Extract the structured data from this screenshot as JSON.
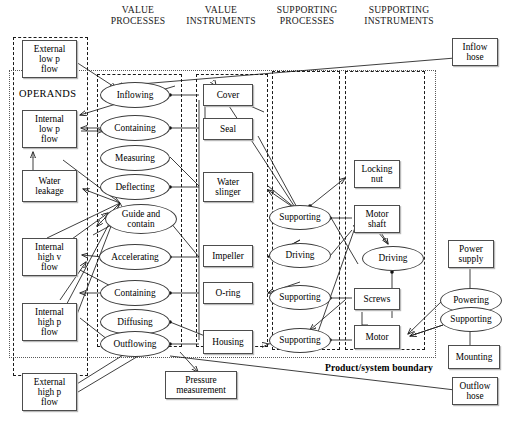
{
  "diagram": {
    "title_label": "Product/system boundary",
    "operands_label": "OPERANDS",
    "column_headers": [
      {
        "id": "value-processes",
        "label": "VALUE\nPROCESSES"
      },
      {
        "id": "value-instruments",
        "label": "VALUE\nINSTRUMENTS"
      },
      {
        "id": "supporting-processes",
        "label": "SUPPORTING\nPROCESSES"
      },
      {
        "id": "supporting-instruments",
        "label": "SUPPORTING\nINSTRUMENTS"
      }
    ],
    "operands": [
      {
        "id": "external-low-p-flow",
        "label": "External\nlow p\nflow"
      },
      {
        "id": "internal-low-p-flow",
        "label": "Internal\nlow p\nflow"
      },
      {
        "id": "water-leakage",
        "label": "Water\nleakage"
      },
      {
        "id": "internal-high-v-flow",
        "label": "Internal\nhigh v\nflow"
      },
      {
        "id": "internal-high-p-flow",
        "label": "Internal\nhigh p\nflow"
      },
      {
        "id": "external-high-p-flow",
        "label": "External\nhigh p\nflow"
      }
    ],
    "value_processes": [
      {
        "id": "inflowing",
        "label": "Inflowing"
      },
      {
        "id": "containing-upper",
        "label": "Containing"
      },
      {
        "id": "measuring",
        "label": "Measuring"
      },
      {
        "id": "deflecting",
        "label": "Deflecting"
      },
      {
        "id": "guide-and-contain",
        "label": "Guide and\ncontain"
      },
      {
        "id": "accelerating",
        "label": "Accelerating"
      },
      {
        "id": "containing-lower",
        "label": "Containing"
      },
      {
        "id": "diffusing",
        "label": "Diffusing"
      },
      {
        "id": "outflowing",
        "label": "Outflowing"
      }
    ],
    "value_instruments": [
      {
        "id": "cover",
        "label": "Cover"
      },
      {
        "id": "seal",
        "label": "Seal"
      },
      {
        "id": "water-slinger",
        "label": "Water\nslinger"
      },
      {
        "id": "impeller",
        "label": "Impeller"
      },
      {
        "id": "o-ring",
        "label": "O-ring"
      },
      {
        "id": "housing",
        "label": "Housing"
      }
    ],
    "supporting_processes": [
      {
        "id": "supporting-1",
        "label": "Supporting"
      },
      {
        "id": "driving-1",
        "label": "Driving"
      },
      {
        "id": "supporting-2",
        "label": "Supporting"
      },
      {
        "id": "supporting-3",
        "label": "Supporting"
      }
    ],
    "supporting_instruments": [
      {
        "id": "locking-nut",
        "label": "Locking\nnut"
      },
      {
        "id": "motor-shaft",
        "label": "Motor\nshaft"
      },
      {
        "id": "driving-2",
        "label": "Driving"
      },
      {
        "id": "screws",
        "label": "Screws"
      },
      {
        "id": "motor",
        "label": "Motor"
      }
    ],
    "external_entities": [
      {
        "id": "inflow-hose",
        "label": "Inflow\nhose"
      },
      {
        "id": "outflow-hose",
        "label": "Outflow\nhose"
      },
      {
        "id": "pressure-measurement",
        "label": "Pressure\nmeasurement"
      },
      {
        "id": "power-supply",
        "label": "Power\nsupply"
      },
      {
        "id": "powering",
        "label": "Powering"
      },
      {
        "id": "supporting-ext",
        "label": "Supporting"
      },
      {
        "id": "mounting",
        "label": "Mounting"
      }
    ],
    "colors": {
      "line": "#1c1c1c",
      "box_border": "#4d4d4d",
      "lane_border": "#1a1a1a",
      "system_boundary": "#5a5a5a",
      "background": "#ffffff"
    }
  }
}
